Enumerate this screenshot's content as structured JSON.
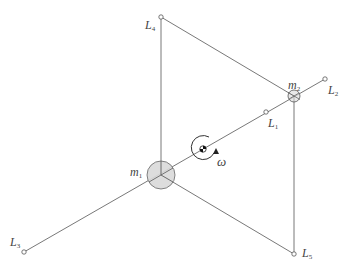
{
  "diagram": {
    "colors": {
      "line": "#555555",
      "mass_fill": "#d9d9d9",
      "mass_stroke": "#666666",
      "background": "#ffffff"
    },
    "nodes": {
      "m1": {
        "label_base": "m",
        "label_sub": "1",
        "x": 161,
        "y": 175,
        "r": 14
      },
      "m2": {
        "label_base": "m",
        "label_sub": "2",
        "x": 294,
        "y": 96,
        "r": 6
      },
      "L1": {
        "label_base": "L",
        "label_sub": "1",
        "x": 266,
        "y": 112
      },
      "L2": {
        "label_base": "L",
        "label_sub": "2",
        "x": 325,
        "y": 79
      },
      "L3": {
        "label_base": "L",
        "label_sub": "3",
        "x": 24,
        "y": 252
      },
      "L4": {
        "label_base": "L",
        "label_sub": "4",
        "x": 161,
        "y": 17
      },
      "L5": {
        "label_base": "L",
        "label_sub": "5",
        "x": 294,
        "y": 254
      }
    },
    "rotation": {
      "symbol": "ω",
      "center_x": 203,
      "center_y": 149
    },
    "edges": [
      [
        "L3",
        "L2"
      ],
      [
        "m1",
        "L4"
      ],
      [
        "L4",
        "m2"
      ],
      [
        "m1",
        "L5"
      ],
      [
        "m2",
        "L5"
      ]
    ]
  }
}
